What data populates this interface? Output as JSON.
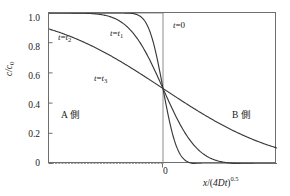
{
  "figure": {
    "background": "#ffffff",
    "frame_color": "#6e6e6e",
    "curve_color": "#3a3a3a"
  },
  "axes": {
    "y_title_parts": {
      "numerator": "c",
      "slash": "/",
      "denominator": "c",
      "denominator_sub": "0"
    },
    "x_title_parts": {
      "x": "x",
      "slash": "/",
      "open": "(",
      "inner": "4Dt",
      "close": ")",
      "exponent": "0.5"
    },
    "y_ticks": [
      "1.0",
      "0.8",
      "0.6",
      "0.4",
      "0.2",
      "0"
    ],
    "y_tick_values": [
      1.0,
      0.8,
      0.6,
      0.4,
      0.2,
      0.0
    ],
    "x_ticks": [
      "0"
    ],
    "x_tick_values": [
      0
    ]
  },
  "annotations": {
    "t0": {
      "text_prefix": "t",
      "eq": "=",
      "value": "0"
    },
    "t1": {
      "text_prefix": "t",
      "eq": "=",
      "value": "t",
      "sub": "1"
    },
    "t2": {
      "text_prefix": "t",
      "eq": "=",
      "value": "t",
      "sub": "2"
    },
    "t3": {
      "text_prefix": "t",
      "eq": "=",
      "value": "t",
      "sub": "3"
    },
    "side_a": "A 側",
    "side_b": "B 側"
  },
  "chart_data": {
    "type": "line",
    "title": "",
    "subtitle": "",
    "xlabel": "x/(4Dt)^0.5",
    "ylabel": "c/c0",
    "xlim": [
      -3.0,
      3.0
    ],
    "ylim": [
      0.0,
      1.0
    ],
    "grid": false,
    "legend": "inline-annotations",
    "x": [
      -3.0,
      -2.75,
      -2.5,
      -2.25,
      -2.0,
      -1.75,
      -1.5,
      -1.25,
      -1.0,
      -0.75,
      -0.5,
      -0.25,
      0.0,
      0.25,
      0.5,
      0.75,
      1.0,
      1.25,
      1.5,
      1.75,
      2.0,
      2.25,
      2.5,
      2.75,
      3.0
    ],
    "series": [
      {
        "name": "t=0",
        "label": "t = 0",
        "style": "step",
        "values": [
          1.0,
          1.0,
          1.0,
          1.0,
          1.0,
          1.0,
          1.0,
          1.0,
          1.0,
          1.0,
          1.0,
          1.0,
          0.5,
          0.0,
          0.0,
          0.0,
          0.0,
          0.0,
          0.0,
          0.0,
          0.0,
          0.0,
          0.0,
          0.0,
          0.0
        ]
      },
      {
        "name": "t=t1",
        "label": "t = t1",
        "style": "solid",
        "erfc_scale": 0.42,
        "values": [
          1.0,
          1.0,
          1.0,
          1.0,
          1.0,
          1.0,
          1.0,
          0.999,
          0.992,
          0.962,
          0.884,
          0.733,
          0.5,
          0.267,
          0.116,
          0.038,
          0.008,
          0.001,
          0.0,
          0.0,
          0.0,
          0.0,
          0.0,
          0.0,
          0.0
        ]
      },
      {
        "name": "t=t2",
        "label": "t = t2",
        "style": "solid",
        "erfc_scale": 1.0,
        "values": [
          0.998,
          0.995,
          0.99,
          0.981,
          0.966,
          0.943,
          0.91,
          0.862,
          0.8,
          0.724,
          0.637,
          0.54,
          0.5,
          0.46,
          0.363,
          0.276,
          0.2,
          0.138,
          0.09,
          0.057,
          0.034,
          0.019,
          0.01,
          0.005,
          0.002
        ]
      },
      {
        "name": "t=t3",
        "label": "t = t3",
        "style": "solid",
        "erfc_scale": 3.4,
        "values": [
          0.838,
          0.823,
          0.808,
          0.792,
          0.776,
          0.76,
          0.744,
          0.727,
          0.71,
          0.693,
          0.675,
          0.588,
          0.5,
          0.479,
          0.45,
          0.425,
          0.4,
          0.375,
          0.35,
          0.325,
          0.3,
          0.26,
          0.222,
          0.193,
          0.166
        ]
      }
    ],
    "crossing_point": {
      "x": 0,
      "y": 0.5
    },
    "baseline_dotted": {
      "y": 0.0,
      "from_x": -3.0,
      "to_x": 0.0
    }
  }
}
